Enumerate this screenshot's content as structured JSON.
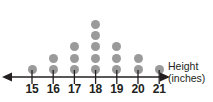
{
  "chart_data": {
    "type": "bar",
    "plot_style": "dot-plot",
    "title": "",
    "subtitle": "",
    "xlabel": "Height (inches)",
    "ylabel": "",
    "categories": [
      "15",
      "16",
      "17",
      "18",
      "19",
      "20",
      "21"
    ],
    "values": [
      1,
      2,
      3,
      5,
      3,
      2,
      1
    ],
    "series": [
      {
        "name": "count",
        "values": [
          1,
          2,
          3,
          5,
          3,
          2,
          1
        ]
      }
    ],
    "xlim": [
      15,
      21
    ],
    "ylim": [
      0,
      5
    ],
    "grid": false,
    "legend": null,
    "annotations": [],
    "total_count": 17,
    "axis_arrows": [
      "left",
      "right"
    ],
    "colors": {
      "dot": "#9a9a9a",
      "axis": "#231f20",
      "label": "#231f20",
      "background": "#ffffff"
    }
  },
  "axis": {
    "title_line1": "Height",
    "title_line2": "(inches)",
    "ticks": [
      "15",
      "16",
      "17",
      "18",
      "19",
      "20",
      "21"
    ]
  },
  "icons": {
    "left_arrow": "arrow-left-icon",
    "right_arrow": "arrow-right-icon"
  }
}
